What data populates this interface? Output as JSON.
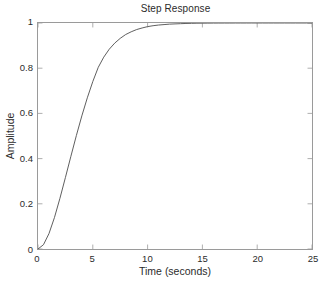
{
  "figure": {
    "background_color": "#ffffff",
    "axes_color": "#9a9a9a",
    "text_color": "#2b2b2b",
    "line_color": "#4d4d4d"
  },
  "chart_data": {
    "type": "line",
    "title": "Step Response",
    "xlabel": "Time (seconds)",
    "ylabel": "Amplitude",
    "xlim": [
      0,
      25
    ],
    "ylim": [
      0,
      1
    ],
    "xticks": [
      0,
      5,
      10,
      15,
      20,
      25
    ],
    "yticks": [
      0,
      0.2,
      0.4,
      0.6,
      0.8,
      1
    ],
    "xtick_labels": [
      "0",
      "5",
      "10",
      "15",
      "20",
      "25"
    ],
    "ytick_labels": [
      "0",
      "0.2",
      "0.4",
      "0.6",
      "0.8",
      "1"
    ],
    "grid": false,
    "legend": null,
    "box": true,
    "tick_direction": "in",
    "series": [
      {
        "name": "Step Response",
        "color": "#4d4d4d",
        "line_width": 0.9,
        "x": [
          0,
          0.5,
          1,
          1.5,
          2,
          2.5,
          3,
          3.5,
          4,
          4.5,
          5,
          5.5,
          6,
          6.5,
          7,
          7.5,
          8,
          8.5,
          9,
          9.5,
          10,
          10.5,
          11,
          11.5,
          12,
          12.5,
          13,
          13.5,
          14,
          14.5,
          15,
          15.5,
          16,
          16.5,
          17,
          17.5,
          18,
          18.5,
          19,
          19.5,
          20,
          20.5,
          21,
          21.5,
          22,
          22.5,
          23,
          23.5,
          24,
          24.5,
          25
        ],
        "y": [
          0,
          0.019,
          0.068,
          0.139,
          0.224,
          0.316,
          0.41,
          0.502,
          0.589,
          0.669,
          0.741,
          0.804,
          0.849,
          0.884,
          0.911,
          0.932,
          0.949,
          0.961,
          0.971,
          0.978,
          0.984,
          0.988,
          0.991,
          0.993,
          0.995,
          0.996,
          0.997,
          0.998,
          0.9985,
          0.999,
          0.9992,
          0.9994,
          0.9996,
          0.9997,
          0.9998,
          0.9998,
          0.9999,
          0.9999,
          0.9999,
          1,
          1,
          1,
          1,
          1,
          1,
          1,
          1,
          1,
          1,
          1,
          1
        ]
      }
    ]
  }
}
